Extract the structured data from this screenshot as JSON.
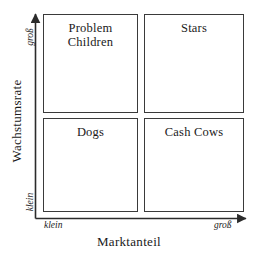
{
  "diagram": {
    "type": "bcg-growth-share-matrix",
    "axes": {
      "x": {
        "title": "Marktanteil",
        "low_label": "klein",
        "high_label": "groß"
      },
      "y": {
        "title": "Wachstumsrate",
        "low_label": "klein",
        "high_label": "groß"
      }
    },
    "quadrants": [
      {
        "id": "problem-children",
        "label": "Problem\nChildren",
        "x": "low",
        "y": "high"
      },
      {
        "id": "stars",
        "label": "Stars",
        "x": "high",
        "y": "high"
      },
      {
        "id": "dogs",
        "label": "Dogs",
        "x": "low",
        "y": "low"
      },
      {
        "id": "cash-cows",
        "label": "Cash Cows",
        "x": "high",
        "y": "low"
      }
    ],
    "colors": {
      "background": "#ffffff",
      "stroke": "#3a3a3a",
      "text": "#1a1a1a"
    }
  }
}
